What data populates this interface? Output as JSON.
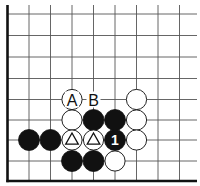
{
  "board": {
    "background": "#ffffff",
    "line_color": "#555555",
    "edge_color": "#111111",
    "columns_x": [
      7.5,
      29,
      50.5,
      72,
      93.5,
      115,
      136.5,
      158,
      179.5
    ],
    "rows_y": [
      14,
      35.5,
      57,
      78.5,
      99.5,
      120,
      140,
      161,
      181
    ],
    "right_extent": 197,
    "top_extent": 5,
    "stone_radius": 10.5
  },
  "stones": [
    {
      "color": "white",
      "col": 3,
      "row": 4
    },
    {
      "color": "white",
      "col": 6,
      "row": 4
    },
    {
      "color": "white",
      "col": 3,
      "row": 5
    },
    {
      "color": "black",
      "col": 4,
      "row": 5
    },
    {
      "color": "black",
      "col": 5,
      "row": 5
    },
    {
      "color": "white",
      "col": 6,
      "row": 5
    },
    {
      "color": "black",
      "col": 1,
      "row": 6
    },
    {
      "color": "black",
      "col": 2,
      "row": 6
    },
    {
      "color": "white",
      "col": 3,
      "row": 6,
      "mark": "triangle"
    },
    {
      "color": "white",
      "col": 4,
      "row": 6,
      "mark": "triangle"
    },
    {
      "color": "black",
      "col": 5,
      "row": 6,
      "label": "1"
    },
    {
      "color": "white",
      "col": 6,
      "row": 6
    },
    {
      "color": "black",
      "col": 3,
      "row": 7
    },
    {
      "color": "black",
      "col": 4,
      "row": 7
    },
    {
      "color": "white",
      "col": 5,
      "row": 7
    }
  ],
  "labels": [
    {
      "text": "A",
      "col": 3,
      "row": 4
    },
    {
      "text": "B",
      "col": 4,
      "row": 4
    }
  ]
}
